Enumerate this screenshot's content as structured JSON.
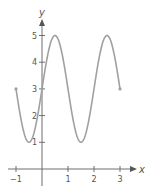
{
  "chart_data": {
    "type": "line",
    "title": "",
    "xlabel": "x",
    "ylabel": "y",
    "function": "y = 3 + 2 sin(πx)",
    "xlim": [
      -1,
      3
    ],
    "ylim": [
      0,
      5
    ],
    "x_ticks": [
      -1,
      1,
      2,
      3
    ],
    "x_tick_labels": [
      "−1",
      "1",
      "2",
      "3"
    ],
    "y_ticks": [
      1,
      2,
      3,
      4,
      5
    ],
    "y_tick_labels": [
      "1",
      "2",
      "3",
      "4",
      "5"
    ],
    "grid": false,
    "legend": null,
    "series": [
      {
        "name": "curve",
        "x": [
          -1,
          -0.75,
          -0.5,
          -0.25,
          0,
          0.25,
          0.5,
          0.75,
          1,
          1.25,
          1.5,
          1.75,
          2,
          2.25,
          2.5,
          2.75,
          3
        ],
        "values": [
          3,
          1.59,
          1,
          1.59,
          3,
          4.41,
          5,
          4.41,
          3,
          1.59,
          1,
          1.59,
          3,
          4.41,
          5,
          4.41,
          3
        ],
        "color": "#a0a0a0"
      }
    ],
    "key_points": {
      "maxima": [
        [
          0.5,
          5
        ],
        [
          2.5,
          5
        ]
      ],
      "minima": [
        [
          -0.5,
          1
        ],
        [
          1.5,
          1
        ]
      ],
      "endpoints": [
        [
          -1,
          3
        ],
        [
          3,
          3
        ]
      ]
    }
  },
  "colors": {
    "axis": "#6e6e6e",
    "curve": "#a0a0a0",
    "text": "#555555"
  },
  "layout": {
    "origin_px": [
      42,
      169
    ],
    "x_unit_px": 26,
    "y_unit_px": 26.7
  }
}
